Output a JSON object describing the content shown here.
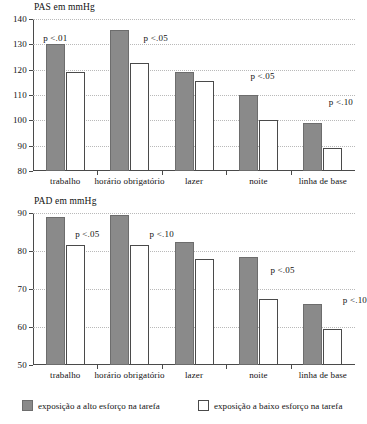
{
  "legend": {
    "entries": [
      {
        "key": "high",
        "label": "exposição a alto esforço na tarefa",
        "color": "#8a8a8a"
      },
      {
        "key": "low",
        "label": "exposição a baixo esforço na tarefa",
        "color": "#ffffff"
      }
    ]
  },
  "chart_data": [
    {
      "type": "bar",
      "id": "pas",
      "title": "PAS em mmHg",
      "xlabel": "",
      "ylabel": "",
      "ylim": [
        80,
        140
      ],
      "yticks": [
        80,
        90,
        100,
        110,
        120,
        130,
        140
      ],
      "grid": true,
      "legend_position": "bottom",
      "categories": [
        "trabalho",
        "horário obrigatório",
        "lazer",
        "noite",
        "linha de base"
      ],
      "series": [
        {
          "name": "exposição a alto esforço na tarefa",
          "values": [
            130,
            135.5,
            119,
            110,
            99
          ]
        },
        {
          "name": "exposição a baixo esforço na tarefa",
          "values": [
            119,
            122.5,
            115.5,
            100,
            89
          ]
        }
      ],
      "annotations": [
        {
          "category": "trabalho",
          "text": "p <.01"
        },
        {
          "category": "horário obrigatório",
          "text": "p <.05"
        },
        {
          "category": "lazer",
          "text": ""
        },
        {
          "category": "noite",
          "text": "p <.05"
        },
        {
          "category": "linha de base",
          "text": "p <.10"
        }
      ]
    },
    {
      "type": "bar",
      "id": "pad",
      "title": "PAD em mmHg",
      "xlabel": "",
      "ylabel": "",
      "ylim": [
        50,
        90
      ],
      "yticks": [
        50,
        60,
        70,
        80,
        90
      ],
      "grid": true,
      "legend_position": "bottom",
      "categories": [
        "trabalho",
        "horário obrigatório",
        "lazer",
        "noite",
        "linha de base"
      ],
      "series": [
        {
          "name": "exposição a alto esforço na tarefa",
          "values": [
            89,
            89.5,
            82.5,
            78.5,
            66
          ]
        },
        {
          "name": "exposição a baixo esforço na tarefa",
          "values": [
            81.5,
            81.5,
            78,
            67.5,
            59.5
          ]
        }
      ],
      "annotations": [
        {
          "category": "trabalho",
          "text": "p <.05"
        },
        {
          "category": "horário obrigatório",
          "text": "p <.10"
        },
        {
          "category": "lazer",
          "text": ""
        },
        {
          "category": "noite",
          "text": "p <.05"
        },
        {
          "category": "linha de base",
          "text": "p <.10"
        }
      ]
    }
  ]
}
